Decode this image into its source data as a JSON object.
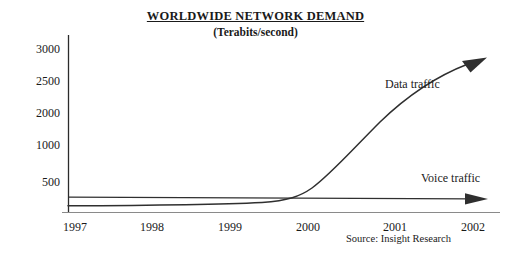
{
  "chart_data": {
    "type": "line",
    "title": "WORLDWIDE NETWORK DEMAND",
    "subtitle": "(Terabits/second)",
    "xlabel": "",
    "ylabel": "",
    "unit": "Terabits/second",
    "grid": false,
    "legend_position": "inline-annotation",
    "source": "Source: Insight Research",
    "x": [
      "1997",
      "1998",
      "1999",
      "2000",
      "2001",
      "2002"
    ],
    "xtick_labels": [
      "1997",
      "1998",
      "1999",
      "2000",
      "2001",
      "2002"
    ],
    "ytick_labels": [
      "3000",
      "2500",
      "2000",
      "1000",
      "500"
    ],
    "ylim": [
      0,
      3200
    ],
    "series": [
      {
        "name": "Data traffic",
        "label": "Data traffic",
        "color": "#333333",
        "arrow": true,
        "values": [
          20,
          40,
          90,
          260,
          1250,
          2750
        ]
      },
      {
        "name": "Voice traffic",
        "label": "Voice traffic",
        "color": "#333333",
        "arrow": true,
        "values": [
          210,
          212,
          215,
          218,
          222,
          228
        ]
      }
    ],
    "annotations": [
      {
        "text": "Data traffic",
        "series": "Data traffic"
      },
      {
        "text": "Voice traffic",
        "series": "Voice traffic"
      }
    ]
  },
  "axes": {
    "y_axis_name": "y-axis-line",
    "x_axis_name": "x-axis-line"
  }
}
